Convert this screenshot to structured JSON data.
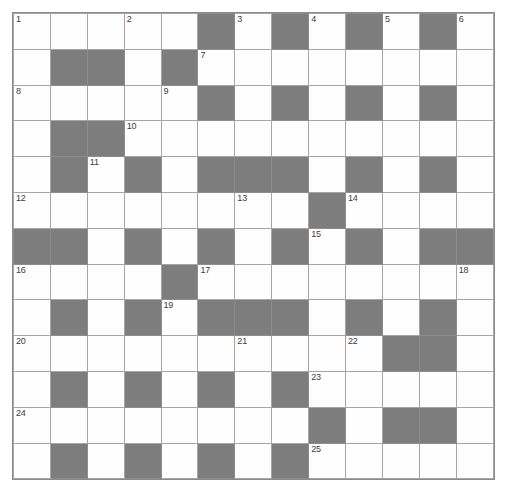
{
  "puzzle": {
    "title": "Crossword Grid",
    "type": "crossword",
    "columns": 13,
    "rows": 13,
    "colors": {
      "block_fill": "#7d7d7d",
      "cell_fill": "#fefefe",
      "grid_line": "#a6a6a6",
      "number_text": "#3c3c3c",
      "page_background": "#ffffff"
    },
    "legend": {
      "white_cell": "W",
      "block_cell": "B"
    },
    "grid": [
      [
        "W",
        "W",
        "W",
        "W",
        "W",
        "B",
        "W",
        "B",
        "W",
        "B",
        "W",
        "B",
        "W"
      ],
      [
        "W",
        "B",
        "B",
        "W",
        "B",
        "W",
        "W",
        "W",
        "W",
        "W",
        "W",
        "W",
        "W"
      ],
      [
        "W",
        "W",
        "W",
        "W",
        "W",
        "B",
        "W",
        "B",
        "W",
        "B",
        "W",
        "B",
        "W"
      ],
      [
        "W",
        "B",
        "B",
        "W",
        "W",
        "W",
        "W",
        "W",
        "W",
        "W",
        "W",
        "W",
        "W"
      ],
      [
        "W",
        "B",
        "W",
        "B",
        "W",
        "B",
        "B",
        "B",
        "W",
        "B",
        "W",
        "B",
        "W"
      ],
      [
        "W",
        "W",
        "W",
        "W",
        "W",
        "W",
        "W",
        "W",
        "B",
        "W",
        "W",
        "W",
        "W"
      ],
      [
        "B",
        "B",
        "W",
        "B",
        "W",
        "B",
        "W",
        "B",
        "W",
        "B",
        "W",
        "B",
        "B"
      ],
      [
        "W",
        "W",
        "W",
        "W",
        "B",
        "W",
        "W",
        "W",
        "W",
        "W",
        "W",
        "W",
        "W"
      ],
      [
        "W",
        "B",
        "W",
        "B",
        "W",
        "B",
        "B",
        "B",
        "W",
        "B",
        "W",
        "B",
        "W"
      ],
      [
        "W",
        "W",
        "W",
        "W",
        "W",
        "W",
        "W",
        "W",
        "W",
        "W",
        "B",
        "B",
        "W"
      ],
      [
        "W",
        "B",
        "W",
        "B",
        "W",
        "B",
        "W",
        "B",
        "W",
        "W",
        "W",
        "W",
        "W"
      ],
      [
        "W",
        "W",
        "W",
        "W",
        "W",
        "W",
        "W",
        "W",
        "B",
        "W",
        "B",
        "B",
        "W"
      ],
      [
        "W",
        "B",
        "W",
        "B",
        "W",
        "B",
        "W",
        "B",
        "W",
        "W",
        "W",
        "W",
        "W"
      ]
    ],
    "numbers": [
      {
        "n": "1",
        "row": 1,
        "col": 1
      },
      {
        "n": "2",
        "row": 1,
        "col": 4
      },
      {
        "n": "3",
        "row": 1,
        "col": 7
      },
      {
        "n": "4",
        "row": 1,
        "col": 9
      },
      {
        "n": "5",
        "row": 1,
        "col": 11
      },
      {
        "n": "6",
        "row": 1,
        "col": 13
      },
      {
        "n": "7",
        "row": 2,
        "col": 6
      },
      {
        "n": "8",
        "row": 3,
        "col": 1
      },
      {
        "n": "9",
        "row": 3,
        "col": 5
      },
      {
        "n": "10",
        "row": 4,
        "col": 4
      },
      {
        "n": "11",
        "row": 5,
        "col": 3
      },
      {
        "n": "12",
        "row": 6,
        "col": 1
      },
      {
        "n": "13",
        "row": 6,
        "col": 7
      },
      {
        "n": "14",
        "row": 6,
        "col": 10
      },
      {
        "n": "15",
        "row": 7,
        "col": 9
      },
      {
        "n": "16",
        "row": 8,
        "col": 1
      },
      {
        "n": "17",
        "row": 8,
        "col": 6
      },
      {
        "n": "18",
        "row": 8,
        "col": 13
      },
      {
        "n": "19",
        "row": 9,
        "col": 5
      },
      {
        "n": "20",
        "row": 10,
        "col": 1
      },
      {
        "n": "21",
        "row": 10,
        "col": 7
      },
      {
        "n": "22",
        "row": 10,
        "col": 10
      },
      {
        "n": "23",
        "row": 11,
        "col": 9
      },
      {
        "n": "24",
        "row": 12,
        "col": 1
      },
      {
        "n": "25",
        "row": 13,
        "col": 9
      }
    ],
    "entries": []
  }
}
